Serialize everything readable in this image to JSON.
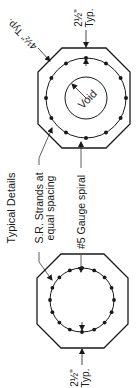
{
  "title": "Typical Details",
  "labels": {
    "corner_chamfer": "4½\" Typ.",
    "top_cover_value": "2½\"",
    "top_cover_typ": "Typ.",
    "bottom_cover_value": "2½\"",
    "bottom_cover_typ": "Typ.",
    "strands_line1": "S.R. Strands at",
    "strands_line2": "equal spacing",
    "spiral": "#5 Gauge spiral",
    "void": "Void"
  },
  "colors": {
    "line": "#1a1a1a",
    "background": "#ffffff"
  },
  "details": [
    {
      "name": "hollow-pile-section",
      "strand_count": 12,
      "has_void": true
    },
    {
      "name": "solid-pile-section",
      "strand_count": 16,
      "has_void": false
    }
  ]
}
